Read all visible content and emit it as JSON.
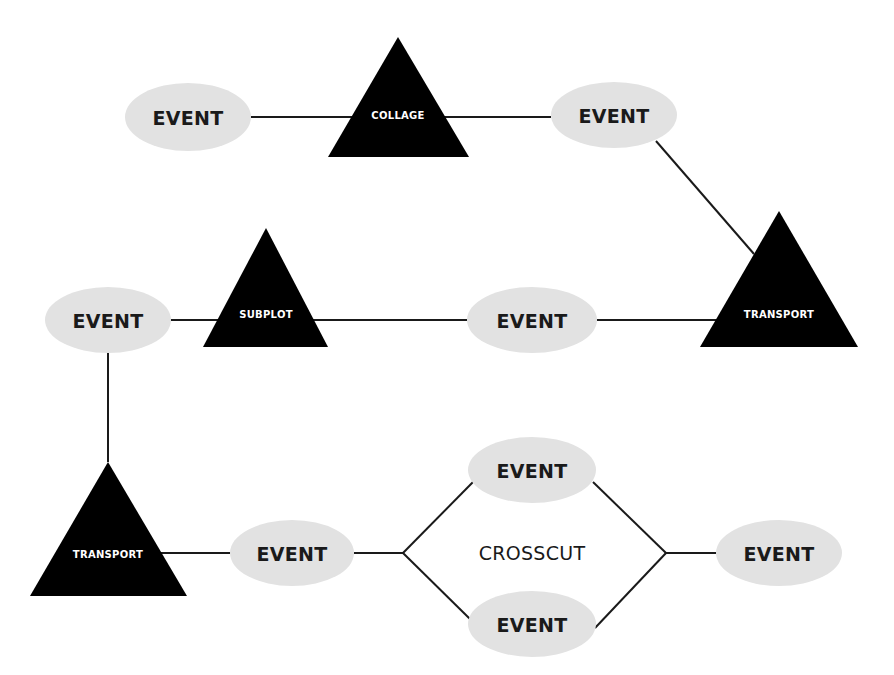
{
  "diagram": {
    "colors": {
      "event_fill": "#e2e2e2",
      "event_text": "#1a1a1a",
      "triangle_fill": "#000000",
      "triangle_text": "#ffffff",
      "line": "#1a1a1a"
    },
    "events": [
      {
        "id": "e1",
        "label": "EVENT",
        "cx": 188,
        "cy": 117,
        "rx": 63,
        "ry": 34
      },
      {
        "id": "e2",
        "label": "EVENT",
        "cx": 614,
        "cy": 115,
        "rx": 63,
        "ry": 33
      },
      {
        "id": "e3",
        "label": "EVENT",
        "cx": 108,
        "cy": 320,
        "rx": 63,
        "ry": 33
      },
      {
        "id": "e4",
        "label": "EVENT",
        "cx": 532,
        "cy": 320,
        "rx": 65,
        "ry": 33
      },
      {
        "id": "e5",
        "label": "EVENT",
        "cx": 292,
        "cy": 553,
        "rx": 62,
        "ry": 33
      },
      {
        "id": "e6",
        "label": "EVENT",
        "cx": 532,
        "cy": 470,
        "rx": 64,
        "ry": 33
      },
      {
        "id": "e7",
        "label": "EVENT",
        "cx": 532,
        "cy": 624,
        "rx": 64,
        "ry": 33
      },
      {
        "id": "e8",
        "label": "EVENT",
        "cx": 779,
        "cy": 553,
        "rx": 63,
        "ry": 33
      }
    ],
    "triangles": [
      {
        "id": "t1",
        "label": "COLLAGE",
        "apex": [
          398,
          37
        ],
        "base_y": 157,
        "base_left": 328,
        "base_right": 469,
        "label_y": 115
      },
      {
        "id": "t2",
        "label": "TRANSPORT",
        "apex": [
          779,
          211
        ],
        "base_y": 347,
        "base_left": 700,
        "base_right": 858,
        "label_y": 314
      },
      {
        "id": "t3",
        "label": "SUBPLOT",
        "apex": [
          266,
          228
        ],
        "base_y": 347,
        "base_left": 203,
        "base_right": 328,
        "label_y": 314
      },
      {
        "id": "t4",
        "label": "TRANSPORT",
        "apex": [
          108,
          462
        ],
        "base_y": 596,
        "base_left": 30,
        "base_right": 187,
        "label_y": 554
      }
    ],
    "crosscut": {
      "label": "CROSSCUT",
      "x": 532,
      "y": 553
    },
    "connectors": [
      [
        251,
        117,
        362,
        117
      ],
      [
        435,
        117,
        551,
        117
      ],
      [
        656,
        141,
        754,
        254
      ],
      [
        597,
        320,
        721,
        320
      ],
      [
        309,
        320,
        467,
        320
      ],
      [
        171,
        320,
        228,
        320
      ],
      [
        108,
        353,
        108,
        462
      ],
      [
        156,
        553,
        230,
        553
      ],
      [
        354,
        553,
        403,
        553
      ],
      [
        403,
        553,
        473,
        482
      ],
      [
        403,
        553,
        470,
        619
      ],
      [
        593,
        482,
        666,
        553
      ],
      [
        595,
        628,
        666,
        553
      ],
      [
        666,
        553,
        716,
        553
      ]
    ]
  }
}
